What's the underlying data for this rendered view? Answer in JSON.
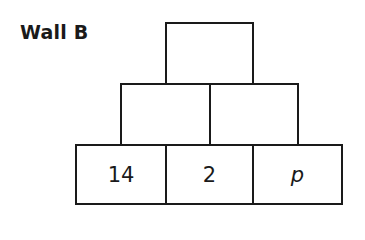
{
  "title": "Wall B",
  "wall": {
    "rows": [
      {
        "level": "top",
        "bricks": [
          {
            "value": ""
          }
        ]
      },
      {
        "level": "middle",
        "bricks": [
          {
            "value": ""
          },
          {
            "value": ""
          }
        ]
      },
      {
        "level": "bottom",
        "bricks": [
          {
            "value": "14"
          },
          {
            "value": "2"
          },
          {
            "value": "p",
            "italic": true
          }
        ]
      }
    ]
  }
}
